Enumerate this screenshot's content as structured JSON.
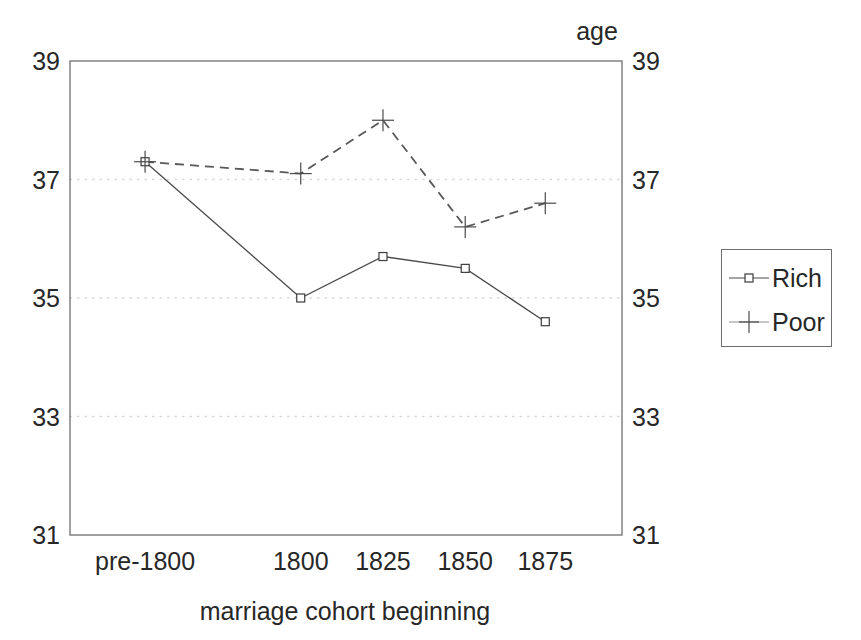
{
  "chart_data": {
    "type": "line",
    "title": "",
    "subtitle": "",
    "xlabel": "marriage cohort beginning",
    "ylabel": "age",
    "categories": [
      "pre-1800",
      "1800",
      "1825",
      "1850",
      "1875"
    ],
    "series": [
      {
        "name": "Rich",
        "marker": "open-square",
        "linestyle": "solid",
        "values": [
          37.3,
          35.0,
          35.7,
          35.5,
          34.6
        ]
      },
      {
        "name": "Poor",
        "marker": "plus",
        "linestyle": "dashed",
        "values": [
          37.3,
          37.1,
          38.0,
          36.2,
          36.6
        ]
      }
    ],
    "ylim": [
      31,
      39
    ],
    "yticks": [
      31,
      33,
      35,
      37,
      39
    ],
    "ytick_labels": [
      "31",
      "33",
      "35",
      "37",
      "39"
    ],
    "y_axis_labels_both_sides": true,
    "grid": true,
    "gridlines_at": [
      33,
      35,
      37
    ],
    "grid_style": "dotted",
    "legend_position": "right-outside",
    "legend_entries": [
      "Rich",
      "Poor"
    ],
    "colors": {
      "ink": "#4a4a4a",
      "text": "#272727",
      "frame": "#6e6e6e",
      "grid": "#d8d8d8",
      "background": "#ffffff"
    }
  },
  "axes": {
    "y_title": "age",
    "x_title": "marriage cohort beginning"
  },
  "legend": {
    "items": [
      {
        "label": "Rich"
      },
      {
        "label": "Poor"
      }
    ]
  }
}
